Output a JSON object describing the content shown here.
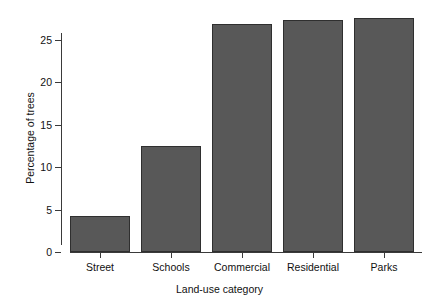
{
  "chart_data": {
    "type": "bar",
    "title": "",
    "subtitle": "",
    "xlabel": "Land-use category",
    "ylabel": "Percentage of trees",
    "categories": [
      "Street",
      "Schools",
      "Commercial",
      "Residential",
      "Parks"
    ],
    "values": [
      4.2,
      12.5,
      26.8,
      27.3,
      27.6
    ],
    "ylim": [
      0,
      28.5
    ],
    "y_ticks": [
      0,
      5,
      10,
      15,
      20,
      25
    ],
    "y_tick_labels": [
      "0",
      "5",
      "10",
      "15",
      "20",
      "25"
    ],
    "grid": false,
    "legend": false,
    "legend_position": "none",
    "bar_fill_color": "#585858",
    "bar_border_color": "#2f2f2f",
    "axis_color": "#3a3a3a",
    "background_color": "#ffffff",
    "series": [
      {
        "name": "Percentage of trees",
        "values": [
          4.2,
          12.5,
          26.8,
          27.3,
          27.6
        ]
      }
    ]
  }
}
